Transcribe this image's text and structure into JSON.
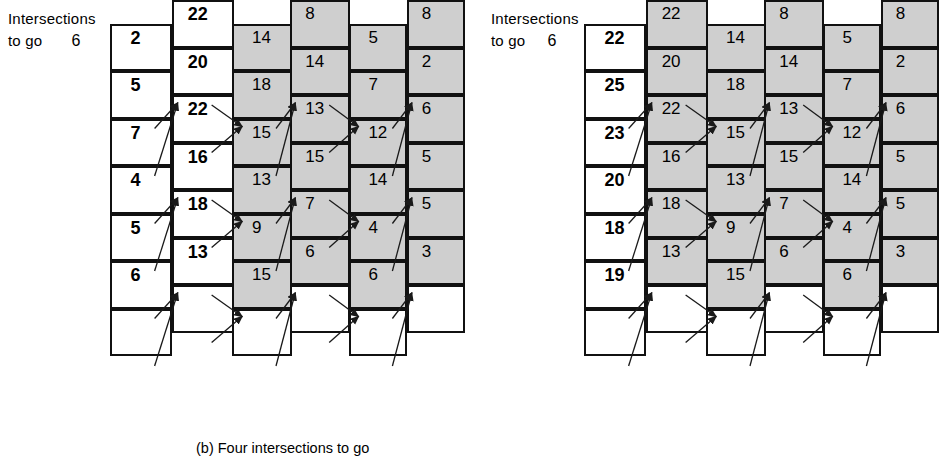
{
  "figure": {
    "axis_label_line1": "Intersections",
    "axis_label_line2": "to go",
    "column_numbers": [
      "6",
      "5",
      "4",
      "3",
      "2",
      "1",
      "0"
    ]
  },
  "panels": [
    {
      "id": "b",
      "caption": "(b) Four intersections to go",
      "columns": [
        {
          "index": "6",
          "style": "none",
          "values": []
        },
        {
          "index": "5",
          "style": "white",
          "values": [
            "2",
            "5",
            "7",
            "4",
            "5",
            "6"
          ]
        },
        {
          "index": "4",
          "style": "white",
          "values": [
            "22",
            "20",
            "22",
            "16",
            "18",
            "13"
          ]
        },
        {
          "index": "3",
          "style": "shaded",
          "values": [
            "14",
            "18",
            "15",
            "13",
            "9",
            "15"
          ]
        },
        {
          "index": "2",
          "style": "shaded",
          "values": [
            "8",
            "14",
            "13",
            "15",
            "7",
            "6"
          ]
        },
        {
          "index": "1",
          "style": "shaded",
          "values": [
            "5",
            "7",
            "12",
            "14",
            "4",
            "6"
          ]
        },
        {
          "index": "0",
          "style": "shaded",
          "values": [
            "8",
            "2",
            "6",
            "5",
            "5",
            "3"
          ]
        }
      ]
    },
    {
      "id": "c",
      "caption": "(c) Five intersections to go",
      "columns": [
        {
          "index": "6",
          "style": "none",
          "values": []
        },
        {
          "index": "5",
          "style": "white",
          "values": [
            "22",
            "25",
            "23",
            "20",
            "18",
            "19"
          ]
        },
        {
          "index": "4",
          "style": "shaded",
          "values": [
            "22",
            "20",
            "22",
            "16",
            "18",
            "13"
          ]
        },
        {
          "index": "3",
          "style": "shaded",
          "values": [
            "14",
            "18",
            "15",
            "13",
            "9",
            "15"
          ]
        },
        {
          "index": "2",
          "style": "shaded",
          "values": [
            "8",
            "14",
            "13",
            "15",
            "7",
            "6"
          ]
        },
        {
          "index": "1",
          "style": "shaded",
          "values": [
            "5",
            "7",
            "12",
            "14",
            "4",
            "6"
          ]
        },
        {
          "index": "0",
          "style": "shaded",
          "values": [
            "8",
            "2",
            "6",
            "5",
            "5",
            "3"
          ]
        }
      ]
    }
  ],
  "colors": {
    "shade": "#cfcfcf",
    "line": "#111111",
    "background": "#ffffff"
  }
}
